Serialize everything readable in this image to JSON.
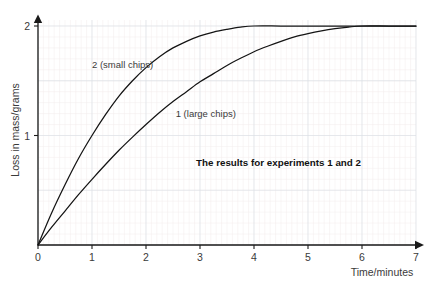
{
  "chart_data": {
    "type": "line",
    "title": "",
    "caption": "The results for experiments 1 and 2",
    "xlabel": "Time/minutes",
    "ylabel": "Loss in mass/grams",
    "xlim": [
      0,
      7
    ],
    "ylim": [
      0,
      2
    ],
    "xticks": [
      "0",
      "1",
      "2",
      "3",
      "4",
      "5",
      "6",
      "7"
    ],
    "xtick_values": [
      0,
      1,
      2,
      3,
      4,
      5,
      6,
      7
    ],
    "yticks": [
      "1",
      "2"
    ],
    "ytick_values": [
      1,
      2
    ],
    "grid": "minor and major gridlines shown",
    "legend": "inline curve labels",
    "grid_minor_color": "#f3eced",
    "grid_major_color": "#d9dfe6",
    "curve_color": "#141414",
    "axis_color": "#1a1a1a",
    "series": [
      {
        "name": "2 (small chips)",
        "label": "2 (small chips)",
        "label_x": 1.0,
        "label_y": 1.62,
        "x": [
          0,
          0.25,
          0.5,
          0.75,
          1.0,
          1.25,
          1.5,
          1.75,
          2.0,
          2.25,
          2.5,
          2.75,
          3.0,
          3.25,
          3.5,
          3.75,
          4.0,
          4.5,
          5.0,
          5.5,
          6.0,
          6.5,
          7.0
        ],
        "y": [
          0,
          0.29,
          0.55,
          0.79,
          1.0,
          1.19,
          1.36,
          1.5,
          1.62,
          1.72,
          1.8,
          1.86,
          1.91,
          1.945,
          1.97,
          1.99,
          2.0,
          2.0,
          2.0,
          2.0,
          2.0,
          2.0,
          2.0
        ]
      },
      {
        "name": "1 (large chips)",
        "label": "1 (large chips)",
        "label_x": 2.55,
        "label_y": 1.17,
        "x": [
          0,
          0.25,
          0.5,
          0.75,
          1.0,
          1.25,
          1.5,
          1.75,
          2.0,
          2.25,
          2.5,
          2.75,
          3.0,
          3.25,
          3.5,
          3.75,
          4.0,
          4.25,
          4.5,
          4.75,
          5.0,
          5.25,
          5.5,
          5.75,
          6.0,
          6.5,
          7.0
        ],
        "y": [
          0,
          0.16,
          0.31,
          0.46,
          0.6,
          0.735,
          0.865,
          0.985,
          1.1,
          1.21,
          1.31,
          1.4,
          1.49,
          1.565,
          1.64,
          1.705,
          1.765,
          1.815,
          1.86,
          1.9,
          1.93,
          1.955,
          1.975,
          1.99,
          2.0,
          2.0,
          2.0
        ]
      }
    ]
  }
}
